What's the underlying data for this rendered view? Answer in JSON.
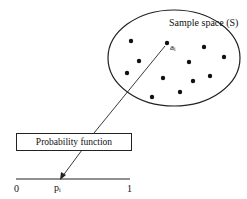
{
  "diagram": {
    "sample_space_label": "Sample space (S)",
    "element_label": "aᵢ",
    "function_box_label": "Probability function",
    "axis": {
      "min_label": "0",
      "max_label": "1",
      "point_label": "pᵢ"
    },
    "sample_points": [
      [
        131,
        41
      ],
      [
        167,
        43
      ],
      [
        204,
        47
      ],
      [
        224,
        57
      ],
      [
        139,
        61
      ],
      [
        189,
        62
      ],
      [
        127,
        73
      ],
      [
        163,
        78
      ],
      [
        210,
        76
      ],
      [
        193,
        81
      ],
      [
        180,
        92
      ],
      [
        152,
        97
      ]
    ]
  }
}
